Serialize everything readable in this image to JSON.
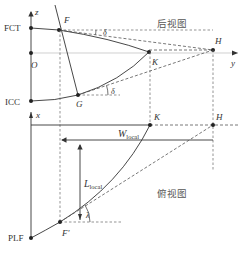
{
  "colors": {
    "line": "#333333",
    "dashed": "#555555",
    "guide": "#bbbbbb",
    "text": "#333333"
  },
  "rear_view": {
    "title": "后视图",
    "axis_z_label": "z",
    "axis_y_label": "y",
    "points": {
      "FCT": "FCT",
      "ICC": "ICC",
      "O": "O",
      "F": "F",
      "G": "G",
      "K": "K",
      "H": "H"
    },
    "angles": {
      "top": "δ",
      "bottom": "δ"
    }
  },
  "top_view": {
    "title": "俯视图",
    "axis_x_label": "x",
    "points": {
      "K": "K",
      "H": "H",
      "F_prime": "F'",
      "PLF": "PLF"
    },
    "dimensions": {
      "width": {
        "main": "W",
        "sub": "local"
      },
      "length": {
        "main": "L",
        "sub": "local"
      }
    },
    "angles": {
      "sweep": "λ"
    }
  }
}
